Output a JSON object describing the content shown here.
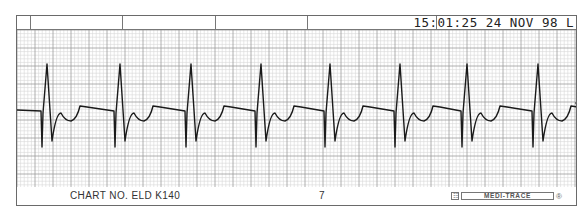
{
  "header": {
    "timestamp": "15:01:25",
    "date": "24 NOV 98",
    "lead_marker": "L",
    "divider_positions": [
      14,
      106,
      199,
      291,
      420
    ]
  },
  "footer": {
    "chart_number": "CHART NO. ELD K140",
    "page_number": "7",
    "brand": "MEDI-TRACE",
    "brand_mark": "®"
  },
  "colors": {
    "trace": "#1a1a1a",
    "grid_minor": "#d4d4d4",
    "grid_major": "#9a9a9a",
    "border": "#6a6a6a",
    "paper": "#ffffff"
  },
  "chart_data": {
    "type": "line",
    "xlabel": "",
    "ylabel": "",
    "grid": true,
    "r_peak_x_px": [
      46,
      119,
      190,
      260,
      329,
      399,
      466,
      537
    ],
    "beats": 8,
    "baseline_y_px": 108,
    "r_peak_y_px": 63,
    "s_trough_y_px": 146,
    "rr_interval_px_avg": 70,
    "annotations": [
      "15:01:25",
      "24 NOV 98",
      "L",
      "CHART NO. ELD K140",
      "7",
      "MEDI-TRACE"
    ]
  }
}
